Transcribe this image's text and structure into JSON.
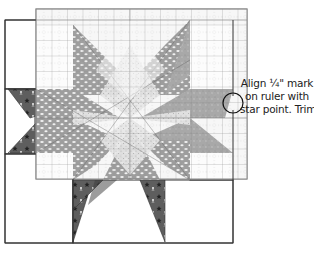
{
  "figure": {
    "type": "quilt-instruction-diagram"
  },
  "callout": {
    "lines": [
      "Align ¼\" mark",
      "on ruler with",
      "star point. Trim."
    ]
  },
  "colors": {
    "block_outline": "#333333",
    "ruler_grid": "#999999",
    "ruler_edge": "#888888",
    "light_fabric": "#dcdcdc",
    "medium_fabric": "#9a9a9a",
    "speckled_fabric": "#b5b5b5",
    "dark_star_fabric": "#5a5a5a",
    "callout_circle": "#111111",
    "background": "#ffffff"
  }
}
